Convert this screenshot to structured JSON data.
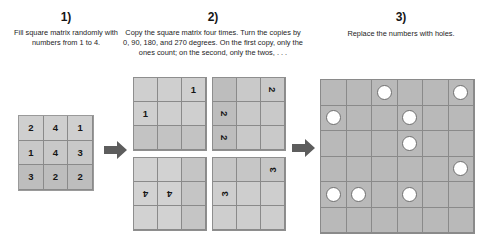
{
  "steps": [
    {
      "number": "1)",
      "caption": "Fill square matrix randomly with numbers from 1 to 4."
    },
    {
      "number": "2)",
      "caption": "Copy the square matrix four times. Turn the copies by 0, 90, 180, and 270 degrees. On the first copy, only the ones count; on the second, only the twos, . . ."
    },
    {
      "number": "3)",
      "caption": "Replace the numbers with holes."
    }
  ],
  "source_matrix": {
    "rows": 3,
    "cols": 3,
    "values": [
      [
        "2",
        "4",
        "1"
      ],
      [
        "1",
        "4",
        "3"
      ],
      [
        "3",
        "2",
        "2"
      ]
    ]
  },
  "copies": [
    {
      "rotation_label": "0",
      "digit": "1",
      "cells": [
        [
          "",
          "",
          "1"
        ],
        [
          "1",
          "",
          ""
        ],
        [
          "",
          "",
          ""
        ]
      ]
    },
    {
      "rotation_label": "90",
      "digit": "2",
      "cells": [
        [
          "",
          "",
          "2"
        ],
        [
          "2",
          "",
          ""
        ],
        [
          "2",
          "",
          ""
        ]
      ]
    },
    {
      "rotation_label": "180",
      "digit": "4",
      "cells": [
        [
          "",
          "",
          ""
        ],
        [
          "4",
          "4",
          ""
        ],
        [
          "",
          "",
          ""
        ]
      ]
    },
    {
      "rotation_label": "270",
      "digit": "3",
      "cells": [
        [
          "",
          "",
          "3"
        ],
        [
          "3",
          "",
          ""
        ],
        [
          "",
          "",
          ""
        ]
      ]
    }
  ],
  "holes_grid": {
    "rows": 6,
    "cols": 6,
    "cells": [
      [
        0,
        0,
        1,
        0,
        0,
        1
      ],
      [
        1,
        0,
        0,
        1,
        0,
        0
      ],
      [
        0,
        0,
        0,
        1,
        0,
        0
      ],
      [
        0,
        0,
        0,
        0,
        0,
        1
      ],
      [
        1,
        1,
        0,
        1,
        0,
        0
      ],
      [
        0,
        0,
        0,
        0,
        0,
        0
      ]
    ]
  },
  "arrows": [
    {
      "name": "arrow-step1-to-step2",
      "direction": "right"
    },
    {
      "name": "arrow-step2-to-step3",
      "direction": "right"
    }
  ],
  "colors": {
    "cell_fill": "#c6c6c6",
    "holes_fill": "#b9b9b9",
    "hole": "#ffffff",
    "grid_line": "#8a8a8a",
    "arrow": "#595959",
    "text": "#1a1a1a"
  }
}
